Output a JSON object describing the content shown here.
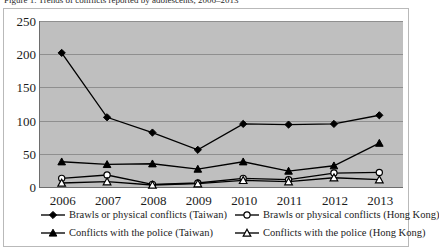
{
  "figure": {
    "caption_sliver": "Figure 1. Trends of conflicts reported by adolescents, 2006–2013"
  },
  "chart_data": {
    "type": "line",
    "title": "",
    "subtitle": "",
    "xlabel": "",
    "ylabel": "",
    "categories": [
      "2006",
      "2007",
      "2008",
      "2009",
      "2010",
      "2011",
      "2012",
      "2013"
    ],
    "x": [
      2006,
      2007,
      2008,
      2009,
      2010,
      2011,
      2012,
      2013
    ],
    "ylim": [
      0,
      250
    ],
    "yticks": [
      0,
      50,
      100,
      150,
      200,
      250
    ],
    "ytick_labels": [
      "0",
      "50",
      "100",
      "150",
      "200",
      "250"
    ],
    "grid": "horizontal",
    "legend_position": "bottom",
    "plot_background": "#bfbfbf",
    "series": [
      {
        "name": "Brawls or physical conflicts (Taiwan)",
        "marker": "filled-diamond",
        "color": "#000000",
        "values": [
          202,
          105,
          82,
          56,
          95,
          94,
          95,
          108
        ]
      },
      {
        "name": "Brawls or physical conflicts (Hong Kong)",
        "marker": "hollow-circle",
        "color": "#000000",
        "values": [
          13,
          18,
          4,
          6,
          13,
          11,
          21,
          22
        ]
      },
      {
        "name": "Conflicts with the police (Taiwan)",
        "marker": "filled-triangle",
        "color": "#000000",
        "values": [
          38,
          34,
          35,
          27,
          38,
          24,
          32,
          66
        ]
      },
      {
        "name": "Conflicts with the police (Hong Kong)",
        "marker": "hollow-triangle",
        "color": "#000000",
        "values": [
          6,
          8,
          3,
          5,
          10,
          8,
          14,
          11
        ]
      }
    ]
  },
  "legend": {
    "items": [
      {
        "label": "Brawls or physical conflicts (Taiwan)",
        "marker": "filled-diamond"
      },
      {
        "label": "Brawls or physical conflicts (Hong Kong)",
        "marker": "hollow-circle"
      },
      {
        "label": "Conflicts with the police (Taiwan)",
        "marker": "filled-triangle"
      },
      {
        "label": "Conflicts with the police (Hong Kong)",
        "marker": "hollow-triangle"
      }
    ]
  },
  "colors": {
    "plot_background": "#bfbfbf",
    "gridline": "#8f8f8f",
    "axis": "#6d6d6d",
    "series": "#000000",
    "text": "#1b1b1b",
    "frame": "#b9b9b9"
  }
}
